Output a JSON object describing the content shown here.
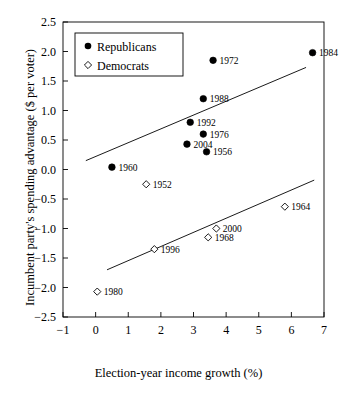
{
  "chart_data": {
    "type": "scatter",
    "title": "",
    "xlabel": "Election-year income growth (%)",
    "ylabel": "Incumbent party's spending advantage ($ per voter)",
    "xlim": [
      -1,
      7
    ],
    "ylim": [
      -2.5,
      2.5
    ],
    "xticks": [
      "-1",
      "0",
      "1",
      "2",
      "3",
      "4",
      "5",
      "6",
      "7"
    ],
    "xtick_values": [
      -1,
      0,
      1,
      2,
      3,
      4,
      5,
      6,
      7
    ],
    "yticks": [
      "2.5",
      "2.0",
      "1.5",
      "1.0",
      "0.5",
      "0.0",
      "-0.5",
      "-1.0",
      "-1.5",
      "-2.0",
      "-2.5"
    ],
    "ytick_values": [
      2.5,
      2.0,
      1.5,
      1.0,
      0.5,
      0.0,
      -0.5,
      -1.0,
      -1.5,
      -2.0,
      -2.5
    ],
    "grid": false,
    "legend_position": "upper-left",
    "series": [
      {
        "name": "Republicans",
        "marker": "filled-circle",
        "color": "#000000",
        "points": [
          {
            "label": "1960",
            "x": 0.5,
            "y": 0.04
          },
          {
            "label": "1992",
            "x": 2.9,
            "y": 0.8
          },
          {
            "label": "2004",
            "x": 2.8,
            "y": 0.43
          },
          {
            "label": "1976",
            "x": 3.3,
            "y": 0.6
          },
          {
            "label": "1956",
            "x": 3.4,
            "y": 0.3
          },
          {
            "label": "1988",
            "x": 3.3,
            "y": 1.2
          },
          {
            "label": "1972",
            "x": 3.6,
            "y": 1.85
          },
          {
            "label": "1984",
            "x": 6.65,
            "y": 1.98
          }
        ],
        "trend_line": {
          "x1": -0.3,
          "y1": 0.15,
          "x2": 6.45,
          "y2": 1.73
        }
      },
      {
        "name": "Democrats",
        "marker": "open-diamond",
        "color": "#000000",
        "points": [
          {
            "label": "1952",
            "x": 1.55,
            "y": -0.25
          },
          {
            "label": "1996",
            "x": 1.8,
            "y": -1.35
          },
          {
            "label": "1968",
            "x": 3.45,
            "y": -1.15
          },
          {
            "label": "2000",
            "x": 3.7,
            "y": -1.0
          },
          {
            "label": "1964",
            "x": 5.8,
            "y": -0.63
          },
          {
            "label": "1980",
            "x": 0.05,
            "y": -2.07
          }
        ],
        "trend_line": {
          "x1": 0.35,
          "y1": -1.7,
          "x2": 6.7,
          "y2": -0.18
        }
      }
    ]
  },
  "legend": {
    "entries": [
      {
        "label": "Republicans",
        "marker": "filled-circle"
      },
      {
        "label": "Democrats",
        "marker": "open-diamond"
      }
    ]
  }
}
